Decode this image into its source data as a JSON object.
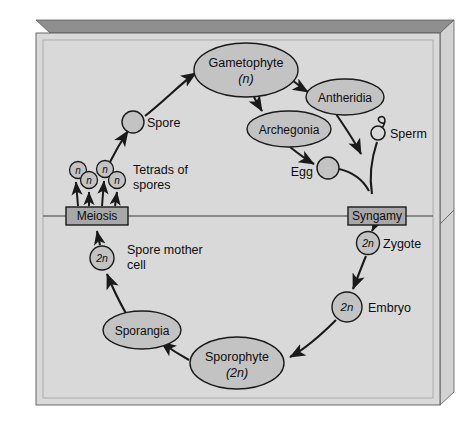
{
  "figure": {
    "panel_fill": "#d9d9d9",
    "node_fill": "#c3c3c3",
    "box_fill": "#a8a8a8",
    "stroke": "#1a1a1a",
    "slab_top_fill": "#8c8c8c",
    "slab_side_fill": "#cfcfcf",
    "page_bg": "#ffffff"
  },
  "divider": {
    "name": "ploidy-divider-line",
    "description": "horizontal line separating haploid (above) and diploid (below) phases"
  },
  "nodes": [
    {
      "id": "gametophyte",
      "shape": "ellipse",
      "label": "Gametophyte",
      "sub": "(n)",
      "cx": 246,
      "cy": 70,
      "rx": 52,
      "ry": 27
    },
    {
      "id": "antheridia",
      "shape": "ellipse",
      "label": "Antheridia",
      "sub": "",
      "cx": 345,
      "cy": 97,
      "rx": 39,
      "ry": 18
    },
    {
      "id": "archegonia",
      "shape": "ellipse",
      "label": "Archegonia",
      "sub": "",
      "cx": 289,
      "cy": 129,
      "rx": 42,
      "ry": 18
    },
    {
      "id": "sporangia",
      "shape": "ellipse",
      "label": "Sporangia",
      "sub": "",
      "cx": 142,
      "cy": 330,
      "rx": 39,
      "ry": 19
    },
    {
      "id": "sporophyte",
      "shape": "ellipse",
      "label": "Sporophyte",
      "sub": "(2n)",
      "cx": 237,
      "cy": 363,
      "rx": 47,
      "ry": 26
    },
    {
      "id": "meiosis",
      "shape": "box",
      "label": "Meiosis",
      "x": 66,
      "y": 207,
      "w": 62,
      "h": 18
    },
    {
      "id": "syngamy",
      "shape": "box",
      "label": "Syngamy",
      "x": 348,
      "y": 207,
      "w": 58,
      "h": 18
    }
  ],
  "cells": [
    {
      "id": "spore",
      "label": "Spore",
      "inner": "",
      "cx": 133,
      "cy": 122,
      "r": 11,
      "label_x": 147,
      "label_y": 126,
      "filled": true
    },
    {
      "id": "tetrad-n-1",
      "label": "",
      "inner": "n",
      "cx": 78,
      "cy": 170,
      "r": 8.5,
      "filled": true
    },
    {
      "id": "tetrad-n-2",
      "label": "",
      "inner": "n",
      "cx": 89,
      "cy": 180,
      "r": 8.5,
      "filled": true
    },
    {
      "id": "tetrad-n-3",
      "label": "",
      "inner": "n",
      "cx": 105,
      "cy": 169,
      "r": 8.5,
      "filled": true
    },
    {
      "id": "tetrad-n-4",
      "label": "",
      "inner": "n",
      "cx": 117,
      "cy": 180,
      "r": 8.5,
      "filled": true
    },
    {
      "id": "spore-mother-cell",
      "label": "",
      "inner": "2n",
      "cx": 102,
      "cy": 258,
      "r": 12,
      "filled": true
    },
    {
      "id": "egg",
      "label": "Egg",
      "inner": "",
      "cx": 328,
      "cy": 168,
      "r": 11,
      "label_x": 296,
      "label_y": 175,
      "filled": true
    },
    {
      "id": "sperm",
      "label": "Sperm",
      "inner": "",
      "cx": 378,
      "cy": 133,
      "r": 7,
      "label_x": 390,
      "label_y": 137,
      "filled": false
    },
    {
      "id": "zygote",
      "label": "Zygote",
      "inner": "2n",
      "cx": 368,
      "cy": 243,
      "r": 11.5,
      "label_x": 383,
      "label_y": 247,
      "filled": true
    },
    {
      "id": "embryo",
      "label": "Embryo",
      "inner": "2n",
      "cx": 347,
      "cy": 307,
      "r": 15,
      "label_x": 367,
      "label_y": 311,
      "filled": true
    }
  ],
  "annotations": [
    {
      "id": "tetrads-of-spores",
      "lines": [
        "Tetrads of",
        "spores"
      ],
      "x": 133,
      "y": 170
    },
    {
      "id": "spore-mother-cell-caption",
      "lines": [
        "Spore mother",
        "cell"
      ],
      "x": 127,
      "y": 250
    }
  ],
  "arrows": [
    {
      "id": "spore-to-gametophyte",
      "from": "spore",
      "to": "gametophyte"
    },
    {
      "id": "gametophyte-to-antheridia",
      "from": "gametophyte",
      "to": "antheridia"
    },
    {
      "id": "gametophyte-to-archegonia",
      "from": "gametophyte",
      "to": "archegonia"
    },
    {
      "id": "antheridia-to-sperm",
      "from": "antheridia",
      "to": "sperm"
    },
    {
      "id": "archegonia-to-egg",
      "from": "archegonia",
      "to": "egg"
    },
    {
      "id": "egg-to-syngamy",
      "from": "egg",
      "to": "syngamy"
    },
    {
      "id": "sperm-to-syngamy",
      "from": "sperm",
      "to": "syngamy"
    },
    {
      "id": "syngamy-to-zygote",
      "from": "syngamy",
      "to": "zygote"
    },
    {
      "id": "zygote-to-embryo",
      "from": "zygote",
      "to": "embryo"
    },
    {
      "id": "embryo-to-sporophyte",
      "from": "embryo",
      "to": "sporophyte"
    },
    {
      "id": "sporophyte-to-sporangia",
      "from": "sporophyte",
      "to": "sporangia"
    },
    {
      "id": "sporangia-to-spore-mother-cell",
      "from": "sporangia",
      "to": "spore-mother-cell"
    },
    {
      "id": "spore-mother-cell-to-meiosis",
      "from": "spore-mother-cell",
      "to": "meiosis"
    },
    {
      "id": "meiosis-to-tetrad-1",
      "from": "meiosis",
      "to": "tetrad-n-1"
    },
    {
      "id": "meiosis-to-tetrad-2",
      "from": "meiosis",
      "to": "tetrad-n-2"
    },
    {
      "id": "meiosis-to-tetrad-3",
      "from": "meiosis",
      "to": "tetrad-n-3"
    },
    {
      "id": "meiosis-to-tetrad-4",
      "from": "meiosis",
      "to": "tetrad-n-4"
    },
    {
      "id": "tetrad-to-spore",
      "from": "tetrad-n-3",
      "to": "spore"
    }
  ]
}
